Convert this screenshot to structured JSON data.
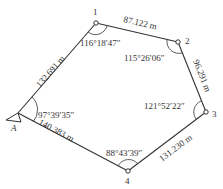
{
  "diagram": {
    "type": "closed traverse",
    "points": [
      {
        "id": "A",
        "label": "A",
        "x": 14,
        "y": 115
      },
      {
        "id": "1",
        "label": "1",
        "x": 96,
        "y": 23
      },
      {
        "id": "2",
        "label": "2",
        "x": 178,
        "y": 42
      },
      {
        "id": "3",
        "label": "3",
        "x": 206,
        "y": 112
      },
      {
        "id": "4",
        "label": "4",
        "x": 128,
        "y": 171
      }
    ],
    "distances": [
      {
        "from": "A",
        "to": "1",
        "label": "132.691 m"
      },
      {
        "from": "1",
        "to": "2",
        "label": "87.122 m"
      },
      {
        "from": "2",
        "to": "3",
        "label": "96.291 m"
      },
      {
        "from": "3",
        "to": "4",
        "label": "131.230 m"
      },
      {
        "from": "4",
        "to": "A",
        "label": "140.383 m"
      }
    ],
    "angles": [
      {
        "at": "A",
        "label": "97°39′35″"
      },
      {
        "at": "1",
        "label": "116°18′47″"
      },
      {
        "at": "2",
        "label": "115°26′06″"
      },
      {
        "at": "3",
        "label": "121°52′22″"
      },
      {
        "at": "4",
        "label": "88°43′39″"
      }
    ]
  }
}
